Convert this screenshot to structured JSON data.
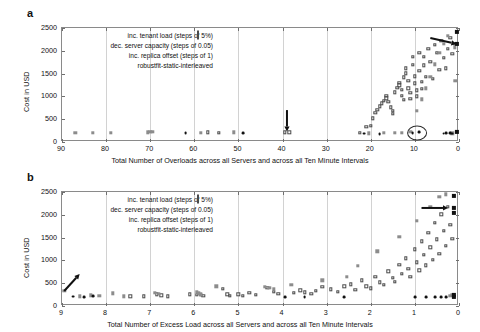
{
  "figure": {
    "panels": [
      {
        "letter": "a",
        "ylabel": "Cost in USD",
        "xlabel": "Total Number of Overloads across all Servers and across all Ten Minute Intervals"
      },
      {
        "letter": "b",
        "ylabel": "Cost in USD",
        "xlabel": "Total Number of Excess Load across all Servers and across all Ten Minute Intervals"
      }
    ],
    "legend": [
      {
        "label": "inc. tenant load (steps of 5%)",
        "marker": "open-square",
        "color": "#4a4a4a"
      },
      {
        "label": "dec. server capacity (steps of 0.05)",
        "marker": "gray-square",
        "color": "#8c8c8c"
      },
      {
        "label": "inc. replica offset (steps of 1)",
        "marker": "dark-circle",
        "color": "#111111"
      },
      {
        "label": "robustfit-static-interleaved",
        "marker": "black-square",
        "color": "#111111"
      }
    ]
  },
  "chart_data": [
    {
      "type": "scatter",
      "title": "",
      "xlabel": "Total Number of Overloads across all Servers and across all Ten Minute Intervals",
      "ylabel": "Cost in USD",
      "xlim": [
        90,
        0
      ],
      "ylim": [
        0,
        2500
      ],
      "x_reversed": true,
      "xticks": [
        90,
        80,
        70,
        60,
        50,
        40,
        30,
        20,
        10,
        0
      ],
      "yticks": [
        0,
        500,
        1000,
        1500,
        2000,
        2500
      ],
      "grid": "vertical",
      "legend_position": "top-center",
      "annotations": [
        {
          "type": "arrow",
          "direction": "down",
          "x": 39,
          "y_from": 700,
          "y_to": 230
        },
        {
          "type": "arrow",
          "direction": "right-down",
          "x_from": 6.5,
          "y_from": 2280,
          "x_to": 0.6,
          "y_to": 2150
        },
        {
          "type": "ellipse",
          "x": 9.5,
          "y": 200,
          "width_x": 4.5,
          "height_y": 330
        }
      ],
      "series": [
        {
          "name": "inc. tenant load (steps of 5%)",
          "marker": "open-square",
          "color": "#4a4a4a",
          "points": [
            [
              57,
              210
            ],
            [
              54.5,
              205
            ],
            [
              39.5,
              215
            ],
            [
              38.5,
              212
            ],
            [
              22.5,
              195
            ],
            [
              21,
              330
            ],
            [
              20,
              360
            ],
            [
              19.5,
              520
            ],
            [
              19,
              640
            ],
            [
              18.5,
              700
            ],
            [
              18,
              780
            ],
            [
              17.5,
              850
            ],
            [
              17,
              905
            ],
            [
              16.5,
              960
            ],
            [
              16.5,
              1010
            ],
            [
              16,
              880
            ],
            [
              15.5,
              760
            ],
            [
              15,
              690
            ],
            [
              15,
              620
            ],
            [
              14.5,
              1090
            ],
            [
              14,
              1190
            ],
            [
              13.5,
              1240
            ],
            [
              13.5,
              1300
            ],
            [
              13,
              1150
            ],
            [
              13,
              1010
            ],
            [
              12.5,
              930
            ],
            [
              12.5,
              1420
            ],
            [
              12,
              1510
            ],
            [
              12,
              1620
            ],
            [
              11.5,
              1340
            ],
            [
              11.5,
              1180
            ],
            [
              11,
              1080
            ],
            [
              11,
              950
            ],
            [
              10.5,
              1690
            ],
            [
              10.5,
              1870
            ],
            [
              10,
              1440
            ],
            [
              10,
              1290
            ],
            [
              9.5,
              1130
            ],
            [
              9.5,
              1000
            ],
            [
              9,
              1960
            ],
            [
              9,
              1560
            ],
            [
              8.5,
              1320
            ],
            [
              8.5,
              1160
            ],
            [
              8,
              1870
            ],
            [
              8,
              1680
            ],
            [
              7.5,
              1430
            ],
            [
              7,
              2050
            ],
            [
              6.5,
              1760
            ],
            [
              6,
              1380
            ],
            [
              5.5,
              2130
            ],
            [
              5,
              1950
            ],
            [
              4.5,
              1580
            ],
            [
              4,
              2220
            ],
            [
              3.5,
              1850
            ],
            [
              3,
              1620
            ],
            [
              2.5,
              2040
            ],
            [
              2,
              2290
            ],
            [
              1.5,
              1930
            ],
            [
              1,
              2150
            ]
          ]
        },
        {
          "name": "dec. server capacity (steps of 0.05)",
          "marker": "gray-square",
          "color": "#8c8c8c",
          "points": [
            [
              87,
              195
            ],
            [
              83,
              205
            ],
            [
              79,
              205
            ],
            [
              70.5,
              215
            ],
            [
              70,
              230
            ],
            [
              69.5,
              220
            ],
            [
              58.5,
              195
            ],
            [
              51,
              210
            ],
            [
              20.5,
              190
            ],
            [
              17,
              205
            ],
            [
              14.5,
              200
            ],
            [
              13,
              195
            ],
            [
              11,
              220
            ],
            [
              9.5,
              690
            ],
            [
              8.5,
              940
            ],
            [
              7.5,
              1180
            ],
            [
              6.5,
              1430
            ],
            [
              5.5,
              1700
            ],
            [
              4.5,
              1950
            ],
            [
              3.5,
              2160
            ],
            [
              2.5,
              2330
            ],
            [
              1.5,
              190
            ],
            [
              1,
              2080
            ],
            [
              0.8,
              1340
            ],
            [
              0.6,
              2150
            ]
          ]
        },
        {
          "name": "inc. replica offset (steps of 1)",
          "marker": "dark-circle",
          "color": "#111111",
          "points": [
            [
              62,
              190
            ],
            [
              49,
              190
            ],
            [
              21.5,
              185
            ],
            [
              18,
              180
            ],
            [
              10.5,
              190
            ],
            [
              9,
              210
            ],
            [
              3.5,
              185
            ],
            [
              3,
              195
            ],
            [
              2,
              190
            ],
            [
              1.5,
              185
            ]
          ]
        },
        {
          "name": "robustfit-static-interleaved",
          "marker": "black-square",
          "color": "#111111",
          "points": [
            [
              0.4,
              2420
            ],
            [
              0.4,
              2150
            ],
            [
              0.4,
              230
            ]
          ]
        }
      ]
    },
    {
      "type": "scatter",
      "title": "",
      "xlabel": "Total Number of Excess Load across all Servers and across all Ten Minute Intervals",
      "ylabel": "Cost in USD",
      "xlim": [
        9,
        0
      ],
      "ylim": [
        0,
        2500
      ],
      "x_reversed": true,
      "xticks": [
        9,
        8,
        7,
        6,
        5,
        4,
        3,
        2,
        1,
        0
      ],
      "yticks": [
        0,
        500,
        1000,
        1500,
        2000,
        2500
      ],
      "grid": "vertical",
      "legend_position": "top-center",
      "annotations": [
        {
          "type": "arrow",
          "direction": "up-right",
          "x_from": 8.95,
          "y_from": 330,
          "x_to": 8.6,
          "y_to": 700
        },
        {
          "type": "arrow",
          "direction": "right",
          "x_from": 0.85,
          "y_from": 2150,
          "x_to": 0.25,
          "y_to": 2150
        }
      ],
      "series": [
        {
          "name": "inc. tenant load (steps of 5%)",
          "marker": "open-square",
          "color": "#4a4a4a",
          "points": [
            [
              7.45,
              215
            ],
            [
              7.15,
              210
            ],
            [
              6.85,
              255
            ],
            [
              6.75,
              235
            ],
            [
              6.6,
              215
            ],
            [
              6.1,
              260
            ],
            [
              5.95,
              250
            ],
            [
              5.85,
              240
            ],
            [
              5.8,
              225
            ],
            [
              5.35,
              380
            ],
            [
              5.25,
              260
            ],
            [
              5.2,
              230
            ],
            [
              5.0,
              255
            ],
            [
              4.9,
              230
            ],
            [
              4.75,
              290
            ],
            [
              4.6,
              250
            ],
            [
              4.35,
              400
            ],
            [
              4.2,
              310
            ],
            [
              4.1,
              265
            ],
            [
              3.75,
              290
            ],
            [
              3.6,
              340
            ],
            [
              3.5,
              300
            ],
            [
              3.35,
              270
            ],
            [
              3.25,
              330
            ],
            [
              3.1,
              420
            ],
            [
              2.9,
              370
            ],
            [
              2.75,
              310
            ],
            [
              2.6,
              430
            ],
            [
              2.45,
              480
            ],
            [
              2.35,
              350
            ],
            [
              2.2,
              560
            ],
            [
              2.1,
              430
            ],
            [
              2.0,
              390
            ],
            [
              1.9,
              640
            ],
            [
              1.8,
              520
            ],
            [
              1.7,
              460
            ],
            [
              1.6,
              760
            ],
            [
              1.5,
              620
            ],
            [
              1.45,
              530
            ],
            [
              1.35,
              900
            ],
            [
              1.3,
              700
            ],
            [
              1.2,
              1050
            ],
            [
              1.15,
              820
            ],
            [
              1.1,
              640
            ],
            [
              1.0,
              1240
            ],
            [
              0.95,
              960
            ],
            [
              0.9,
              780
            ],
            [
              0.85,
              1420
            ],
            [
              0.8,
              1120
            ],
            [
              0.75,
              890
            ],
            [
              0.7,
              1610
            ],
            [
              0.65,
              1290
            ],
            [
              0.6,
              1010
            ],
            [
              0.55,
              1820
            ],
            [
              0.5,
              1460
            ],
            [
              0.45,
              1150
            ],
            [
              0.4,
              2010
            ],
            [
              0.35,
              1650
            ],
            [
              0.3,
              1320
            ],
            [
              0.25,
              2180
            ],
            [
              0.2,
              1780
            ],
            [
              0.15,
              1480
            ]
          ]
        },
        {
          "name": "dec. server capacity (steps of 0.05)",
          "marker": "gray-square",
          "color": "#8c8c8c",
          "points": [
            [
              8.95,
              330
            ],
            [
              8.6,
              215
            ],
            [
              8.35,
              235
            ],
            [
              8.15,
              225
            ],
            [
              7.85,
              275
            ],
            [
              7.6,
              215
            ],
            [
              6.9,
              290
            ],
            [
              6.8,
              270
            ],
            [
              5.95,
              310
            ],
            [
              5.9,
              280
            ],
            [
              5.85,
              255
            ],
            [
              5.5,
              430
            ],
            [
              4.4,
              420
            ],
            [
              4.3,
              400
            ],
            [
              4.2,
              380
            ],
            [
              3.8,
              470
            ],
            [
              3.1,
              560
            ],
            [
              2.55,
              640
            ],
            [
              2.3,
              880
            ],
            [
              1.85,
              1200
            ],
            [
              1.35,
              1520
            ],
            [
              0.95,
              1870
            ],
            [
              0.65,
              2180
            ],
            [
              0.45,
              2400
            ],
            [
              0.3,
              2450
            ],
            [
              0.2,
              230
            ],
            [
              0.15,
              245
            ]
          ]
        },
        {
          "name": "inc. replica offset (steps of 1)",
          "marker": "dark-circle",
          "color": "#111111",
          "points": [
            [
              8.75,
              205
            ],
            [
              8.5,
              200
            ],
            [
              8.3,
              210
            ],
            [
              3.95,
              195
            ],
            [
              3.5,
              200
            ],
            [
              2.6,
              190
            ],
            [
              1.0,
              195
            ],
            [
              0.75,
              190
            ],
            [
              0.55,
              200
            ],
            [
              0.4,
              195
            ],
            [
              0.3,
              190
            ]
          ]
        },
        {
          "name": "robustfit-static-interleaved",
          "marker": "black-square",
          "color": "#111111",
          "points": [
            [
              0.12,
              2420
            ],
            [
              0.12,
              2150
            ],
            [
              0.12,
              2050
            ],
            [
              0.12,
              250
            ],
            [
              0.12,
              200
            ]
          ]
        }
      ]
    }
  ]
}
